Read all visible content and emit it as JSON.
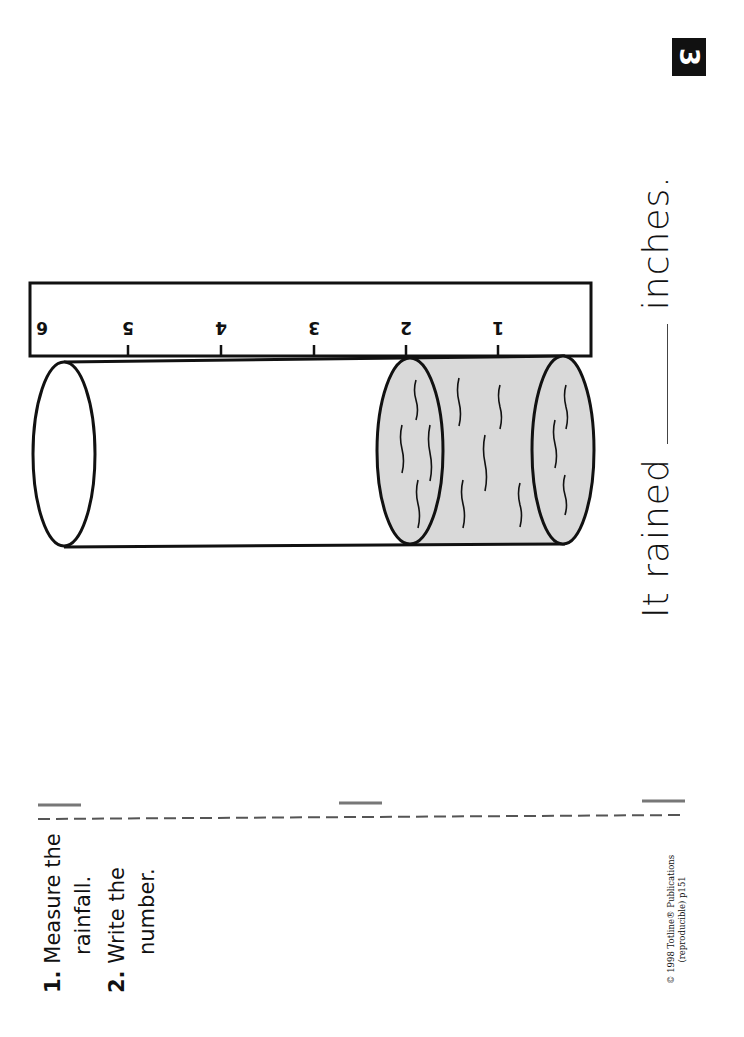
{
  "page_number": "3",
  "instructions": [
    {
      "num": "1.",
      "text_line1": "Measure the",
      "text_line2": "rainfall."
    },
    {
      "num": "2.",
      "text_line1": "Write the",
      "text_line2": "number."
    }
  ],
  "sentence": {
    "before": "It rained",
    "after": "inches."
  },
  "ruler": {
    "ticks": [
      "1",
      "2",
      "3",
      "4",
      "5",
      "6"
    ]
  },
  "water_level_inches": 2,
  "copyright": {
    "line1": "© 1998 Totline® Publications",
    "line2": "(reproducible) p151"
  },
  "colors": {
    "ink": "#111111",
    "water": "#d9d9d9",
    "guide": "#777777"
  }
}
